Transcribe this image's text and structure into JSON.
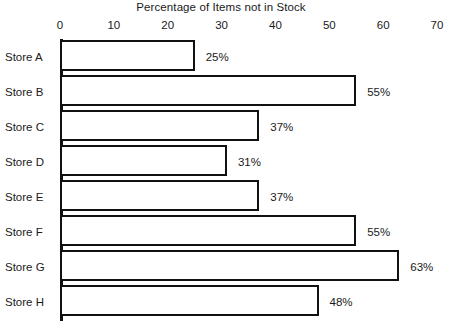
{
  "chart_data": {
    "type": "bar",
    "orientation": "horizontal",
    "title": "Percentage of Items not in Stock",
    "xlabel": "",
    "ylabel": "",
    "xlim": [
      0,
      70
    ],
    "grid": false,
    "legend": null,
    "xticks": [
      "0",
      "10",
      "20",
      "30",
      "40",
      "50",
      "60",
      "70"
    ],
    "xtick_values": [
      0,
      10,
      20,
      30,
      40,
      50,
      60,
      70
    ],
    "categories": [
      "Store A",
      "Store B",
      "Store C",
      "Store D",
      "Store E",
      "Store F",
      "Store G",
      "Store H"
    ],
    "values": [
      25,
      55,
      37,
      31,
      37,
      55,
      63,
      48
    ],
    "value_labels": [
      "25%",
      "55%",
      "37%",
      "31%",
      "37%",
      "55%",
      "63%",
      "48%"
    ],
    "colors": {
      "bar_fill": "#ffffff",
      "bar_stroke": "#111111",
      "axis": "#111111",
      "text": "#1a1a1a",
      "background": "#ffffff"
    }
  }
}
